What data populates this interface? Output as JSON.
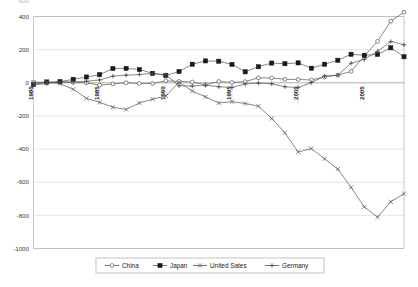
{
  "chart_data": {
    "type": "line",
    "title": "",
    "xlabel": "",
    "ylabel": "",
    "ylim": [
      -1000,
      400
    ],
    "xlim": [
      1980,
      2008
    ],
    "grid": true,
    "legend_position": "bottom",
    "ytick_labels": [
      "400",
      "200",
      "0",
      "-200",
      "-400",
      "-600",
      "-800",
      "-1000"
    ],
    "ytick_values": [
      400,
      200,
      0,
      -200,
      -400,
      -600,
      -800,
      -1000
    ],
    "clipped_top_label": "600",
    "xtick_labels": [
      "1980",
      "1985",
      "1990",
      "1995",
      "2000",
      "2005"
    ],
    "xtick_values": [
      1980,
      1985,
      1990,
      1995,
      2000,
      2005
    ],
    "x": [
      1980,
      1981,
      1982,
      1983,
      1984,
      1985,
      1986,
      1987,
      1988,
      1989,
      1990,
      1991,
      1992,
      1993,
      1994,
      1995,
      1996,
      1997,
      1998,
      1999,
      2000,
      2001,
      2002,
      2003,
      2004,
      2005,
      2006,
      2007,
      2008
    ],
    "series": [
      {
        "name": "China",
        "marker": "open-circle",
        "values": [
          2,
          -1,
          5,
          2,
          -1,
          -14,
          -7,
          0,
          -4,
          -4,
          12,
          8,
          5,
          -12,
          8,
          2,
          7,
          30,
          29,
          21,
          20,
          17,
          35,
          46,
          69,
          161,
          250,
          372,
          426
        ]
      },
      {
        "name": "Japan",
        "marker": "filled-square",
        "values": [
          -11,
          5,
          7,
          21,
          35,
          49,
          86,
          87,
          80,
          57,
          44,
          68,
          112,
          132,
          130,
          111,
          66,
          97,
          119,
          115,
          120,
          88,
          112,
          136,
          172,
          166,
          171,
          211,
          157
        ]
      },
      {
        "name": "United Sates",
        "marker": "x",
        "values": [
          2,
          5,
          -6,
          -39,
          -94,
          -118,
          -147,
          -161,
          -122,
          -99,
          -79,
          3,
          -50,
          -85,
          -122,
          -114,
          -125,
          -141,
          -215,
          -302,
          -418,
          -397,
          -459,
          -521,
          -631,
          -749,
          -811,
          -718,
          -669
        ]
      },
      {
        "name": "Germany",
        "marker": "plus",
        "values": [
          -14,
          -4,
          5,
          5,
          9,
          17,
          40,
          46,
          50,
          57,
          48,
          -18,
          -20,
          -14,
          -24,
          -28,
          -7,
          -2,
          -6,
          -24,
          -29,
          1,
          41,
          46,
          118,
          141,
          190,
          249,
          229
        ]
      }
    ]
  },
  "legend": {
    "entries": [
      {
        "label": "China",
        "marker": "open-circle"
      },
      {
        "label": "Japan",
        "marker": "filled-square"
      },
      {
        "label": "United Sates",
        "marker": "x"
      },
      {
        "label": "Germany",
        "marker": "plus"
      }
    ]
  }
}
